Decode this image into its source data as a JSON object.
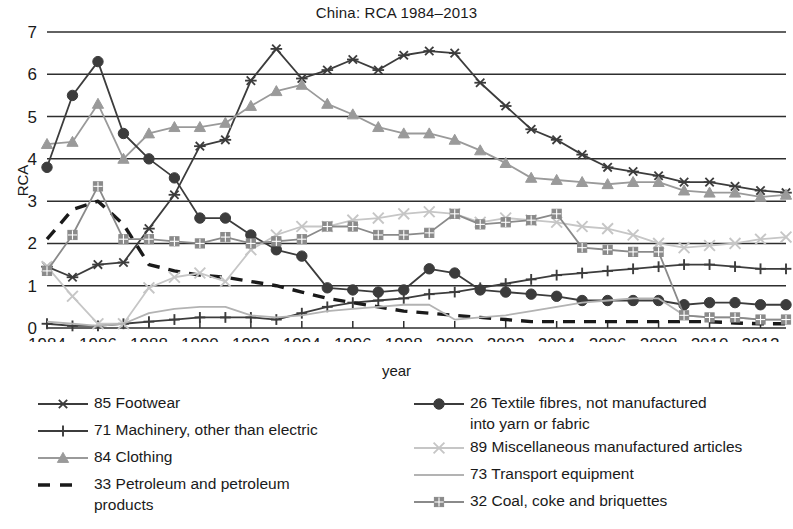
{
  "chart_data": {
    "type": "line",
    "title": "China: RCA 1984–2013",
    "xlabel": "year",
    "ylabel": "RCA",
    "xlim": [
      1984,
      2013
    ],
    "ylim": [
      0,
      7
    ],
    "yticks": [
      0,
      1,
      2,
      3,
      4,
      5,
      6,
      7
    ],
    "xticks": [
      1984,
      1986,
      1988,
      1990,
      1992,
      1994,
      1996,
      1998,
      2000,
      2002,
      2004,
      2006,
      2008,
      2010,
      2012
    ],
    "xtick_labels": [
      "1984",
      "1986",
      "1988",
      "1990",
      "1992",
      "1994",
      "1996",
      "1998",
      "2000",
      "2002",
      "2004",
      "2006",
      "2008",
      "2010",
      "2012"
    ],
    "ytick_labels": [
      "0",
      "1",
      "2",
      "3",
      "4",
      "5",
      "6",
      "7"
    ],
    "grid": "horizontal",
    "legend_position": "below",
    "x": [
      1984,
      1985,
      1986,
      1987,
      1988,
      1989,
      1990,
      1991,
      1992,
      1993,
      1994,
      1995,
      1996,
      1997,
      1998,
      1999,
      2000,
      2001,
      2002,
      2003,
      2004,
      2005,
      2006,
      2007,
      2008,
      2009,
      2010,
      2011,
      2012,
      2013
    ],
    "series": [
      {
        "name": "85 Footwear",
        "code": "85",
        "marker": "asterisk",
        "color": "#3c3c3c",
        "dash": "solid",
        "values": [
          1.45,
          1.2,
          1.5,
          1.55,
          2.35,
          3.15,
          4.3,
          4.45,
          5.85,
          6.6,
          5.9,
          6.1,
          6.35,
          6.1,
          6.45,
          6.55,
          6.5,
          5.8,
          5.25,
          4.7,
          4.45,
          4.1,
          3.8,
          3.7,
          3.6,
          3.45,
          3.45,
          3.35,
          3.25,
          3.2
        ]
      },
      {
        "name": "71 Machinery, other than electric",
        "code": "71",
        "marker": "plus",
        "color": "#3c3c3c",
        "dash": "solid",
        "values": [
          0.1,
          0.05,
          0.05,
          0.1,
          0.15,
          0.2,
          0.25,
          0.25,
          0.25,
          0.2,
          0.35,
          0.5,
          0.6,
          0.65,
          0.7,
          0.8,
          0.85,
          0.95,
          1.05,
          1.15,
          1.25,
          1.3,
          1.35,
          1.4,
          1.45,
          1.5,
          1.5,
          1.45,
          1.4,
          1.4
        ]
      },
      {
        "name": "84 Clothing",
        "code": "84",
        "marker": "triangle",
        "color": "#9a9a9a",
        "dash": "solid",
        "values": [
          4.35,
          4.4,
          5.3,
          4.0,
          4.6,
          4.75,
          4.75,
          4.85,
          5.25,
          5.6,
          5.75,
          5.3,
          5.05,
          4.75,
          4.6,
          4.6,
          4.45,
          4.2,
          3.9,
          3.55,
          3.5,
          3.45,
          3.4,
          3.45,
          3.45,
          3.25,
          3.2,
          3.2,
          3.1,
          3.15
        ]
      },
      {
        "name": "33 Petroleum and petroleum\nproducts",
        "code": "33",
        "marker": "none",
        "color": "#1a1a1a",
        "dash": "dashed",
        "values": [
          2.1,
          2.8,
          3.0,
          2.45,
          1.5,
          1.35,
          1.25,
          1.2,
          1.1,
          1.0,
          0.85,
          0.7,
          0.6,
          0.5,
          0.4,
          0.35,
          0.3,
          0.25,
          0.2,
          0.15,
          0.15,
          0.15,
          0.15,
          0.15,
          0.15,
          0.15,
          0.15,
          0.12,
          0.1,
          0.1
        ]
      },
      {
        "name": "26 Textile fibres, not manufactured\ninto yarn or fabric",
        "code": "26",
        "marker": "circle",
        "color": "#3c3c3c",
        "dash": "solid",
        "values": [
          3.8,
          5.5,
          6.3,
          4.6,
          4.0,
          3.55,
          2.6,
          2.6,
          2.2,
          1.85,
          1.7,
          0.95,
          0.9,
          0.85,
          0.9,
          1.4,
          1.3,
          0.9,
          0.85,
          0.8,
          0.75,
          0.65,
          0.65,
          0.65,
          0.65,
          0.55,
          0.6,
          0.6,
          0.55,
          0.55
        ]
      },
      {
        "name": "89 Miscellaneous manufactured articles",
        "code": "89",
        "marker": "x",
        "color": "#c6c6c6",
        "dash": "solid",
        "values": [
          1.45,
          0.75,
          0.1,
          0.1,
          0.95,
          1.2,
          1.3,
          1.1,
          1.85,
          2.2,
          2.4,
          2.4,
          2.55,
          2.6,
          2.7,
          2.75,
          2.7,
          2.5,
          2.6,
          2.55,
          2.5,
          2.4,
          2.35,
          2.2,
          2.0,
          1.9,
          1.95,
          2.0,
          2.1,
          2.15
        ]
      },
      {
        "name": "73 Transport equipment",
        "code": "73",
        "marker": "none",
        "color": "#b3b3b3",
        "dash": "solid",
        "values": [
          0.15,
          0.1,
          0.05,
          0.1,
          0.35,
          0.45,
          0.5,
          0.5,
          0.3,
          0.25,
          0.3,
          0.4,
          0.45,
          0.5,
          0.55,
          0.55,
          0.2,
          0.25,
          0.3,
          0.4,
          0.5,
          0.6,
          0.65,
          0.7,
          0.7,
          0.3,
          0.25,
          0.25,
          0.2,
          0.2
        ]
      },
      {
        "name": "32 Coal, coke and briquettes",
        "code": "32",
        "marker": "square",
        "color": "#8a8a8a",
        "dash": "solid",
        "values": [
          1.35,
          2.2,
          3.35,
          2.1,
          2.1,
          2.05,
          2.0,
          2.15,
          2.0,
          2.05,
          2.1,
          2.4,
          2.4,
          2.2,
          2.2,
          2.25,
          2.7,
          2.45,
          2.5,
          2.55,
          2.7,
          1.9,
          1.85,
          1.8,
          1.8,
          0.3,
          0.25,
          0.25,
          0.2,
          0.2
        ]
      }
    ]
  },
  "legend": {
    "left": [
      {
        "label": "85 Footwear",
        "marker": "asterisk",
        "color": "#3c3c3c",
        "dash": "solid"
      },
      {
        "label": "71 Machinery, other than electric",
        "marker": "plus",
        "color": "#3c3c3c",
        "dash": "solid"
      },
      {
        "label": "84 Clothing",
        "marker": "triangle",
        "color": "#9a9a9a",
        "dash": "solid"
      },
      {
        "label": "33 Petroleum and petroleum\nproducts",
        "marker": "none",
        "color": "#1a1a1a",
        "dash": "dashed"
      }
    ],
    "right": [
      {
        "label": "26 Textile fibres, not manufactured\ninto yarn or fabric",
        "marker": "circle",
        "color": "#3c3c3c",
        "dash": "solid"
      },
      {
        "label": "89 Miscellaneous manufactured articles",
        "marker": "x",
        "color": "#c6c6c6",
        "dash": "solid"
      },
      {
        "label": "73 Transport equipment",
        "marker": "none",
        "color": "#b3b3b3",
        "dash": "solid"
      },
      {
        "label": "32 Coal, coke and briquettes",
        "marker": "square",
        "color": "#8a8a8a",
        "dash": "solid"
      }
    ]
  },
  "colors": {
    "grid": "#2e2e2e",
    "axis": "#2e2e2e",
    "text": "#1a1a1a",
    "background": "#ffffff"
  }
}
